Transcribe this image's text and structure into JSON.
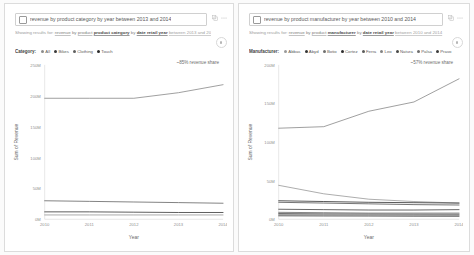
{
  "panels": [
    {
      "id": "product-category",
      "query": {
        "placeholder": "Ask a question about your data",
        "value": "revenue by product category by year between 2013 and 2014",
        "icon": "question-box-icon"
      },
      "tools": [
        {
          "name": "copy-visual-icon",
          "label": "⎘"
        },
        {
          "name": "more-options-icon",
          "label": "⋯"
        }
      ],
      "showing_results": {
        "lead": "Showing results for:",
        "tokens": [
          {
            "text": "revenue",
            "style": "tok"
          },
          {
            "text": "by",
            "style": "plain"
          },
          {
            "text": "product",
            "style": "tok"
          },
          {
            "text": "product category",
            "style": "tok-b"
          },
          {
            "text": "by",
            "style": "plain"
          },
          {
            "text": "date retail year",
            "style": "tok-b"
          },
          {
            "text": "between 2013 and 2014",
            "style": "tok-l"
          }
        ]
      },
      "legend": {
        "title": "Category:",
        "items": [
          {
            "label": "All",
            "color": "#8c8c8c"
          },
          {
            "label": "Bikes",
            "color": "#3a3a3a"
          },
          {
            "label": "Clothing",
            "color": "#5f5f5f"
          },
          {
            "label": "Touch",
            "color": "#2b2b2b"
          }
        ],
        "more": ""
      },
      "annotation": "~85% revenue share",
      "chart_data": {
        "type": "line",
        "title": "",
        "xlabel": "Year",
        "ylabel": "Sum of Revenue",
        "x": [
          2010,
          2011,
          2012,
          2013,
          2014
        ],
        "xtick_labels": [
          "2010",
          "2011",
          "2012",
          "2013",
          "2014"
        ],
        "ylim": [
          0,
          250000000
        ],
        "ytick_values": [
          0,
          50000000,
          100000000,
          150000000,
          200000000,
          250000000
        ],
        "ytick_labels": [
          "0M",
          "50M",
          "100M",
          "150M",
          "200M",
          "250M"
        ],
        "grid": false,
        "legend_position": "top",
        "series": [
          {
            "name": "Bikes",
            "color": "#8e8e8e",
            "values": [
              196000000,
              196000000,
              196000000,
              205000000,
              218000000
            ]
          },
          {
            "name": "Clothing",
            "color": "#6b6b6b",
            "values": [
              30000000,
              29000000,
              28000000,
              27000000,
              26000000
            ]
          },
          {
            "name": "Touch",
            "color": "#3f3f3f",
            "values": [
              12000000,
              12000000,
              11500000,
              11000000,
              11000000
            ]
          },
          {
            "name": "All",
            "color": "#9c9c9c",
            "values": [
              7000000,
              7000000,
              7000000,
              7000000,
              7000000
            ]
          }
        ]
      }
    },
    {
      "id": "product-manufacturer",
      "query": {
        "placeholder": "Ask a question about your data",
        "value": "revenue by product manufacturer by year between 2010 and 2014",
        "icon": "question-box-icon"
      },
      "tools": [
        {
          "name": "copy-visual-icon",
          "label": "⎘"
        },
        {
          "name": "more-options-icon",
          "label": "⋯"
        }
      ],
      "showing_results": {
        "lead": "Showing results for:",
        "tokens": [
          {
            "text": "revenue",
            "style": "tok"
          },
          {
            "text": "by",
            "style": "plain"
          },
          {
            "text": "product",
            "style": "tok"
          },
          {
            "text": "manufacturer",
            "style": "tok-b"
          },
          {
            "text": "by",
            "style": "plain"
          },
          {
            "text": "date retail year",
            "style": "tok-b"
          },
          {
            "text": "between 2010 and 2014",
            "style": "tok-l"
          }
        ]
      },
      "legend": {
        "title": "Manufacturer:",
        "items": [
          {
            "label": "Abbas",
            "color": "#9a9a9a"
          },
          {
            "label": "Abyd",
            "color": "#353535"
          },
          {
            "label": "Botio",
            "color": "#707070"
          },
          {
            "label": "Cortez",
            "color": "#2e2e2e"
          },
          {
            "label": "Ferra",
            "color": "#5b5b5b"
          },
          {
            "label": "Leo",
            "color": "#838383"
          },
          {
            "label": "Natura",
            "color": "#4a4a4a"
          },
          {
            "label": "Palsa",
            "color": "#6d6d6d"
          },
          {
            "label": "Pravo",
            "color": "#3d3d3d"
          }
        ],
        "more": "⋮"
      },
      "annotation": "~57% revenue share",
      "chart_data": {
        "type": "line",
        "title": "",
        "xlabel": "Year",
        "ylabel": "Sum of Revenue",
        "x": [
          2010,
          2011,
          2012,
          2013,
          2014
        ],
        "xtick_labels": [
          "2010",
          "2011",
          "2012",
          "2013",
          "2014"
        ],
        "ylim": [
          0,
          200000000
        ],
        "ytick_values": [
          0,
          50000000,
          100000000,
          150000000,
          200000000
        ],
        "ytick_labels": [
          "0M",
          "50M",
          "100M",
          "150M",
          "200M"
        ],
        "grid": false,
        "legend_position": "top",
        "series": [
          {
            "name": "Cortez",
            "color": "#8e8e8e",
            "values": [
              118000000,
              120000000,
              140000000,
              152000000,
              182000000
            ]
          },
          {
            "name": "Abbas",
            "color": "#9d9d9d",
            "values": [
              44000000,
              33000000,
              26000000,
              23000000,
              21000000
            ]
          },
          {
            "name": "Abyd",
            "color": "#3a3a3a",
            "values": [
              24000000,
              23000000,
              22000000,
              21500000,
              21000000
            ]
          },
          {
            "name": "Botio",
            "color": "#5a5a5a",
            "values": [
              22000000,
              21000000,
              20000000,
              19000000,
              18500000
            ]
          },
          {
            "name": "Ferra",
            "color": "#4a4a4a",
            "values": [
              13000000,
              12500000,
              12000000,
              12000000,
              12500000
            ]
          },
          {
            "name": "Leo",
            "color": "#6f6f6f",
            "values": [
              9000000,
              8500000,
              8000000,
              8000000,
              8000000
            ]
          },
          {
            "name": "Natura",
            "color": "#555555",
            "values": [
              7500000,
              7000000,
              6800000,
              6600000,
              6500000
            ]
          },
          {
            "name": "Palsa",
            "color": "#7d7d7d",
            "values": [
              6000000,
              5800000,
              5600000,
              5400000,
              5200000
            ]
          },
          {
            "name": "Pravo",
            "color": "#444444",
            "values": [
              4500000,
              4300000,
              4200000,
              4000000,
              3900000
            ]
          }
        ]
      }
    }
  ]
}
